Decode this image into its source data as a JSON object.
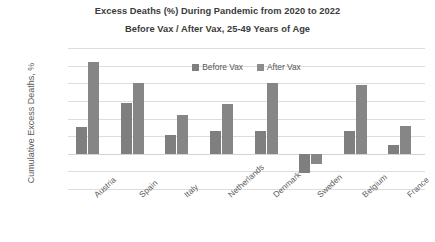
{
  "chart_data": {
    "type": "bar",
    "title": "Excess Deaths (%) During Pandemic from 2020 to 2022",
    "subtitle": "Before Vax / After Vax, 25-49 Years of Age",
    "xlabel": "",
    "ylabel": "Cumulative Excess Deaths, %",
    "ylim": [
      -10,
      30
    ],
    "ytick_step": 5,
    "ytick_labels": [
      "30%",
      "25%",
      "20%",
      "15%",
      "10%",
      "5%",
      "0%",
      "-5%",
      "-10%"
    ],
    "ytick_values": [
      30,
      25,
      20,
      15,
      10,
      5,
      0,
      -5,
      -10
    ],
    "grid": true,
    "legend_position": "top-center",
    "categories": [
      "Austria",
      "Spain",
      "Italy",
      "Netherlands",
      "Denmark",
      "Sweden",
      "Belgium",
      "France"
    ],
    "series": [
      {
        "name": "Before Vax",
        "color": "#7f7f7f",
        "values": [
          7.5,
          14.5,
          5.3,
          6.5,
          6.5,
          -5.5,
          6.5,
          2.5
        ]
      },
      {
        "name": "After Vax",
        "color": "#868686",
        "values": [
          26.0,
          20.0,
          11.0,
          14.0,
          20.0,
          -3.0,
          19.5,
          8.0
        ]
      }
    ]
  }
}
